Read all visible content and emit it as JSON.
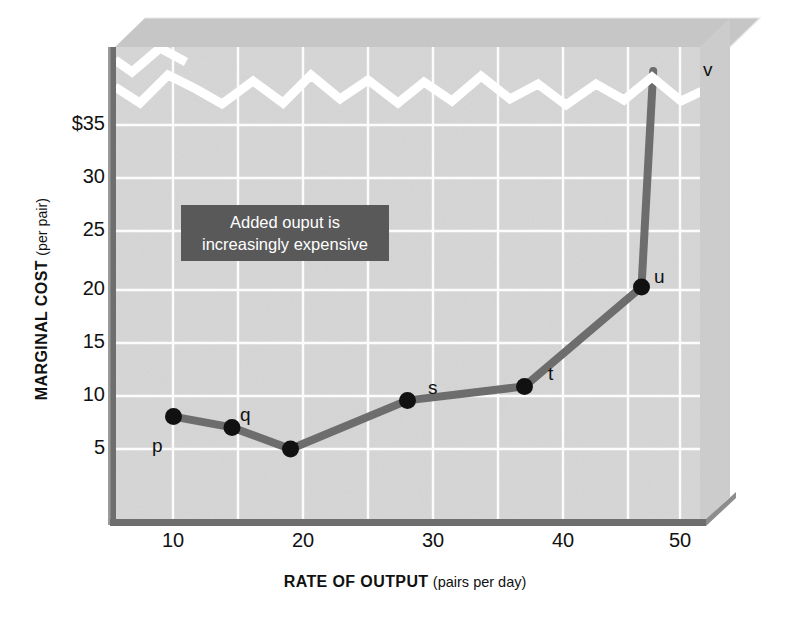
{
  "chart_data": {
    "type": "line",
    "title": "",
    "xlabel": "RATE OF OUTPUT (pairs per day)",
    "xlabel_strong": "RATE OF OUTPUT",
    "xlabel_light": "(pairs per day)",
    "ylabel": "MARGINAL COST (per pair)",
    "ylabel_strong": "MARGINAL COST",
    "ylabel_light": "(per pair)",
    "x_ticks": [
      "10",
      "20",
      "30",
      "40",
      "50"
    ],
    "x_tick_values": [
      10,
      20,
      30,
      40,
      50
    ],
    "y_ticks": [
      "5",
      "10",
      "15",
      "20",
      "25",
      "30",
      "$35"
    ],
    "y_tick_values": [
      5,
      10,
      15,
      20,
      25,
      30,
      35
    ],
    "xlim": [
      5,
      55
    ],
    "ylim": [
      0,
      40
    ],
    "grid": true,
    "axis_break": true,
    "axis_break_note": "jagged white break across top of plot above $35",
    "legend": "none",
    "series": [
      {
        "name": "Marginal cost",
        "point_labels": [
          "p",
          "q",
          "r",
          "s",
          "t",
          "u",
          "v"
        ],
        "x": [
          10,
          15,
          20,
          30,
          40,
          50,
          51
        ],
        "y": [
          8,
          7,
          5,
          9.5,
          10.8,
          20,
          40
        ],
        "markers": [
          true,
          true,
          true,
          true,
          true,
          true,
          false
        ],
        "note_v": "point v runs off the top of the scale (beyond the axis break)"
      }
    ],
    "annotation": {
      "lines": [
        "Added ouput is",
        "increasingly expensive"
      ],
      "background": "#595959",
      "text_color": "#ffffff"
    },
    "colors": {
      "plot_background": "#d5d5d5",
      "grid": "#ffffff",
      "line": "#6b6b6b",
      "marker": "#111111",
      "axis": "#6e6e6e",
      "bevel_top": "#c4c4c4",
      "bevel_side": "#c9c9c9",
      "page_background": "#ffffff"
    }
  },
  "annotation_text": {
    "line1": "Added ouput is",
    "line2": "increasingly expensive"
  },
  "axis": {
    "x_title_strong": "RATE OF OUTPUT",
    "x_title_light": "(pairs per day)",
    "y_title_strong": "MARGINAL COST",
    "y_title_light": "(per pair)"
  },
  "ticks": {
    "y": [
      "$35",
      "30",
      "25",
      "20",
      "15",
      "10",
      "5"
    ],
    "x": [
      "10",
      "20",
      "30",
      "40",
      "50"
    ]
  },
  "point_labels": {
    "p": "p",
    "q": "q",
    "r": "r",
    "s": "s",
    "t": "t",
    "u": "u",
    "v": "v"
  }
}
